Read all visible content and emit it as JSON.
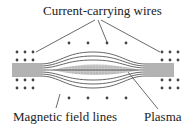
{
  "diagram": {
    "labels": {
      "wires": "Current-carrying wires",
      "field_lines": "Magnetic field lines",
      "plasma": "Plasma"
    },
    "colors": {
      "line": "#555555",
      "dot": "#444444",
      "plasma": "#b8b8b8",
      "text": "#222222"
    }
  }
}
